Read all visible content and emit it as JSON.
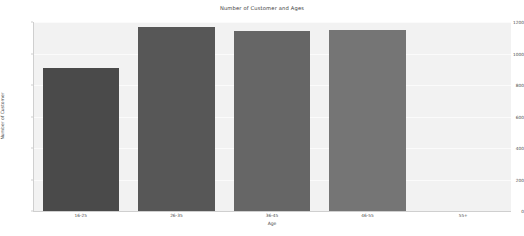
{
  "chart_data": {
    "type": "bar",
    "title": "Number of Customer and Ages",
    "xlabel": "Age",
    "ylabel": "Number of Customer",
    "categories": [
      "16-25",
      "26-35",
      "36-45",
      "46-55",
      "55+"
    ],
    "values": [
      910,
      1170,
      1145,
      1150,
      0
    ],
    "bar_colors": [
      "#4a4a4a",
      "#575757",
      "#666666",
      "#757575",
      "#828282"
    ],
    "ylim": [
      0,
      1200
    ],
    "yticks": [
      0,
      200,
      400,
      600,
      800,
      1000,
      1200
    ],
    "ytick_labels": [
      "0",
      "200",
      "400",
      "600",
      "800",
      "1000",
      "1200"
    ],
    "grid": true,
    "legend": false,
    "plot_background": "#f2f2f2",
    "figure_background": "#ffffff"
  }
}
